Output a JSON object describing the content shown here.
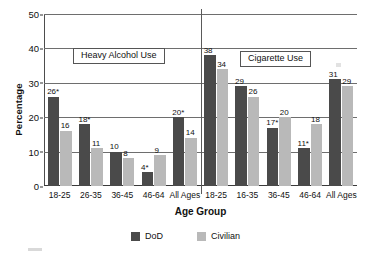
{
  "chart_data": {
    "type": "bar",
    "title": "",
    "xlabel": "Age Group",
    "ylabel": "Percentage",
    "ylim": [
      0,
      50
    ],
    "yticks": [
      0,
      10,
      20,
      30,
      40,
      50
    ],
    "grid": true,
    "legend_position": "bottom",
    "panels": [
      {
        "annotation": "Heavy Alcohol Use",
        "categories": [
          "18-25",
          "26-35",
          "36-45",
          "46-64",
          "All Ages"
        ],
        "series": [
          {
            "name": "DoD",
            "values": [
              26,
              18,
              10,
              4,
              20
            ],
            "labels": [
              "26*",
              "18*",
              "10",
              "4*",
              "20*"
            ]
          },
          {
            "name": "Civilian",
            "values": [
              16,
              11,
              8,
              9,
              14
            ],
            "labels": [
              "16",
              "11",
              "8",
              "9",
              "14"
            ]
          }
        ]
      },
      {
        "annotation": "Cigarette Use",
        "categories": [
          "18-25",
          "16-35",
          "36-45",
          "46-64",
          "All Ages"
        ],
        "series": [
          {
            "name": "DoD",
            "values": [
              38,
              29,
              17,
              11,
              31
            ],
            "labels": [
              "38",
              "29",
              "17*",
              "11*",
              "31"
            ]
          },
          {
            "name": "Civilian",
            "values": [
              34,
              26,
              20,
              18,
              29
            ],
            "labels": [
              "34",
              "26",
              "20",
              "18",
              "29"
            ]
          }
        ]
      }
    ],
    "legend": [
      {
        "label": "DoD",
        "color": "#4a4a4a"
      },
      {
        "label": "Civilian",
        "color": "#b9b9b9"
      }
    ]
  },
  "axes": {
    "y_title": "Percentage",
    "x_title": "Age Group",
    "y_tick_labels": [
      "50",
      "40",
      "30",
      "20",
      "10",
      "0"
    ]
  },
  "annotations": {
    "left_box": "Heavy Alcohol Use",
    "right_box": "Cigarette Use"
  },
  "legend": {
    "dod_label": "DoD",
    "civilian_label": "Civilian"
  },
  "colors": {
    "dod": "#4a4a4a",
    "civilian": "#b9b9b9",
    "grid": "#6e6e6e",
    "axis": "#3a3a3a",
    "background": "#ffffff"
  }
}
